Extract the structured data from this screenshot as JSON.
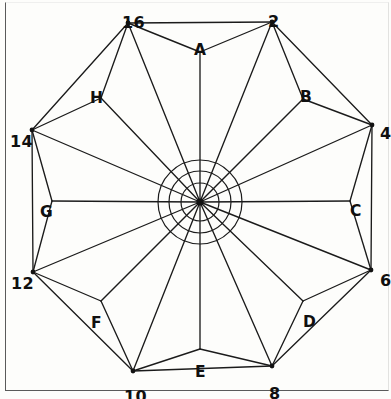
{
  "figure": {
    "center": {
      "x": 200,
      "y": 202,
      "label": "center-hub"
    },
    "background_color": "#fdfdfb",
    "line_color": "#1b1b1b",
    "frame_color": "#5a5a5a",
    "outer_vertices": [
      {
        "id": "v16",
        "label": "16",
        "x": 128,
        "y": 23,
        "label_x": 122,
        "label_y": 16
      },
      {
        "id": "v2",
        "label": "2",
        "x": 272,
        "y": 22,
        "label_x": 268,
        "label_y": 15
      },
      {
        "id": "v4",
        "label": "4",
        "x": 372,
        "y": 125,
        "label_x": 380,
        "label_y": 127
      },
      {
        "id": "v6",
        "label": "6",
        "x": 371,
        "y": 270,
        "label_x": 380,
        "label_y": 274
      },
      {
        "id": "v8",
        "label": "8",
        "x": 272,
        "y": 366,
        "label_x": 269,
        "label_y": 387
      },
      {
        "id": "v10",
        "label": "10",
        "x": 133,
        "y": 371,
        "label_x": 124,
        "label_y": 390
      },
      {
        "id": "v12",
        "label": "12",
        "x": 33,
        "y": 272,
        "label_x": 11,
        "label_y": 277
      },
      {
        "id": "v14",
        "label": "14",
        "x": 32,
        "y": 130,
        "label_x": 10,
        "label_y": 135
      }
    ],
    "inner_vertices": [
      {
        "id": "vA",
        "label": "A",
        "x": 200,
        "y": 52,
        "label_x": 194,
        "label_y": 44
      },
      {
        "id": "vB",
        "label": "B",
        "x": 303,
        "y": 99,
        "label_x": 300,
        "label_y": 91
      },
      {
        "id": "vC",
        "label": "C",
        "x": 350,
        "y": 201,
        "label_x": 350,
        "label_y": 205
      },
      {
        "id": "vD",
        "label": "D",
        "x": 303,
        "y": 301,
        "label_x": 303,
        "label_y": 316
      },
      {
        "id": "vE",
        "label": "E",
        "x": 200,
        "y": 349,
        "label_x": 195,
        "label_y": 366
      },
      {
        "id": "vF",
        "label": "F",
        "x": 101,
        "y": 301,
        "label_x": 91,
        "label_y": 317
      },
      {
        "id": "vG",
        "label": "G",
        "x": 52,
        "y": 201,
        "label_x": 40,
        "label_y": 206
      },
      {
        "id": "vH",
        "label": "H",
        "x": 101,
        "y": 98,
        "label_x": 90,
        "label_y": 92
      }
    ],
    "concentric_circles": [
      {
        "id": "hub-circle-outer",
        "radius": 42
      },
      {
        "id": "hub-circle-middle",
        "radius": 31
      },
      {
        "id": "hub-circle-inner",
        "radius": 19
      }
    ],
    "spoke_count": 16,
    "legend_note": ""
  }
}
